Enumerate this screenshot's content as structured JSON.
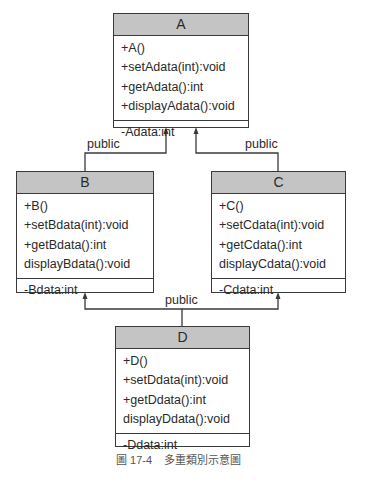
{
  "classes": {
    "A": {
      "name": "A",
      "ops": [
        "+A()",
        "+setAdata(int):void",
        "+getAdata():int",
        "+displayAdata():void"
      ],
      "attr": "-Adata:int"
    },
    "B": {
      "name": "B",
      "ops": [
        "+B()",
        "+setBdata(int):void",
        "+getBdata():int",
        "displayBdata():void"
      ],
      "attr": "-Bdata:int"
    },
    "C": {
      "name": "C",
      "ops": [
        "+C()",
        "+setCdata(int):void",
        "+getCdata():int",
        "displayCdata():void"
      ],
      "attr": "-Cdata:int"
    },
    "D": {
      "name": "D",
      "ops": [
        "+D()",
        "+setDdata(int):void",
        "+getDdata():int",
        "displayDdata():void"
      ],
      "attr": "-Ddata:int"
    }
  },
  "relations": {
    "ba": "public",
    "ca": "public",
    "db": "public"
  },
  "caption": {
    "figure": "圖 17-4",
    "text": "多重類別示意圖"
  }
}
